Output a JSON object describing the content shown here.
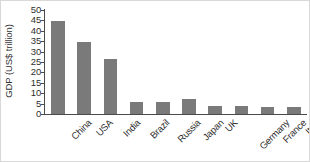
{
  "chart_data": {
    "type": "bar",
    "title": "",
    "xlabel": "",
    "ylabel": "GDP (US$ trillion)",
    "categories": [
      "China",
      "USA",
      "India",
      "Brazil",
      "Russia",
      "Japan",
      "UK",
      "Germany",
      "France",
      "Italy"
    ],
    "values": [
      44.5,
      34.8,
      26.5,
      6.0,
      6.0,
      7.0,
      4.0,
      4.0,
      3.5,
      3.5
    ],
    "ylim": [
      0,
      50
    ],
    "yticks": [
      0,
      5,
      10,
      15,
      20,
      25,
      30,
      35,
      40,
      45,
      50
    ],
    "ytick_labels": [
      "0",
      "5",
      "10",
      "15",
      "20",
      "25",
      "30",
      "35",
      "40",
      "45",
      "50"
    ],
    "grid": false,
    "legend": false,
    "legend_position": "none",
    "bar_color": "#7a7a7a",
    "axis_color": "#4a4a4a",
    "background_color": "#ffffff",
    "xtick_rotation": -45
  }
}
